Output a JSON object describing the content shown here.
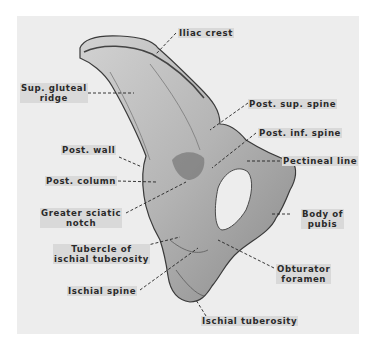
{
  "figure": {
    "background_color": "#ededed",
    "bone_color": "#b9b9b9",
    "leader_color": "#222222"
  },
  "labels": {
    "iliac_crest": "Iliac crest",
    "sup_gluteal_ridge_l1": "Sup. gluteal",
    "sup_gluteal_ridge_l2": "ridge",
    "post_sup_spine": "Post. sup. spine",
    "post_inf_spine": "Post. inf. spine",
    "post_wall": "Post. wall",
    "pectineal_line": "Pectineal line",
    "post_column": "Post. column",
    "greater_sciatic_notch_l1": "Greater sciatic",
    "greater_sciatic_notch_l2": "notch",
    "body_of_pubis_l1": "Body of",
    "body_of_pubis_l2": "pubis",
    "tubercle_l1": "Tubercle of",
    "tubercle_l2": "ischial tuberosity",
    "obturator_foramen_l1": "Obturator",
    "obturator_foramen_l2": "foramen",
    "ischial_spine": "Ischial spine",
    "ischial_tuberosity": "Ischial tuberosity"
  }
}
